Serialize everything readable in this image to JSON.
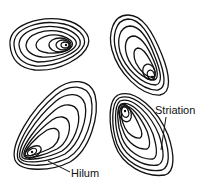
{
  "diagram": {
    "granule_count": 4,
    "labels": {
      "striation": "Striation",
      "hilum": "Hilum"
    },
    "colors": {
      "line": "#111111",
      "background": "#ffffff"
    }
  }
}
